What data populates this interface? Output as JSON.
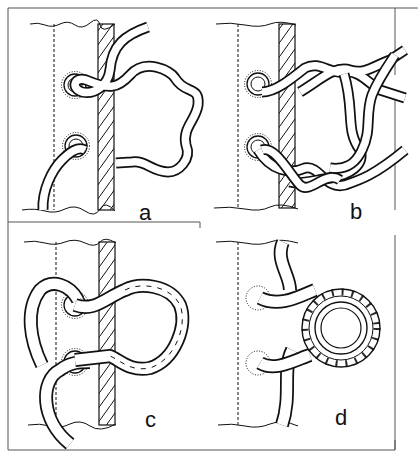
{
  "figure": {
    "panels": [
      {
        "id": "a",
        "label": "a",
        "step": "single strand passed through eyelets forming loose loop"
      },
      {
        "id": "b",
        "label": "b",
        "step": "strand laid back, forming two-strand twisted loop"
      },
      {
        "id": "c",
        "label": "c",
        "step": "three-strand laid rope cringle completed"
      },
      {
        "id": "d",
        "label": "d",
        "step": "cringle with metal thimble inserted"
      }
    ]
  },
  "colors": {
    "ink": "#111111",
    "background": "#ffffff",
    "frame": "#555555"
  }
}
